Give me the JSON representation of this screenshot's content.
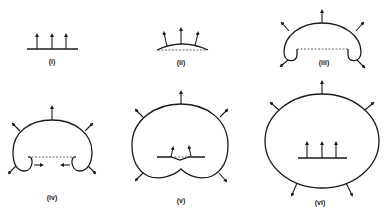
{
  "figure": {
    "panels": [
      {
        "id": "i",
        "label": "(i)",
        "description": "flat surface with three upward arrows"
      },
      {
        "id": "ii",
        "label": "(ii)",
        "description": "slightly curved arc bulging upward over dashed chord, arrows splay outward"
      },
      {
        "id": "iii",
        "label": "(iii)",
        "description": "expanding bubble with curled-under ends, dashed chord, outward arrows"
      },
      {
        "id": "iv",
        "label": "(iv)",
        "description": "larger bubble with curled ends approaching each other, dashed chord, inward arrows at tips"
      },
      {
        "id": "v",
        "label": "(v)",
        "description": "heart-shaped closed loop, ends have met and formed new inner surface with arrows"
      },
      {
        "id": "vi",
        "label": "(vi)",
        "description": "detached closed ellipse with a new flat surface inside with three upward arrows"
      }
    ],
    "line_color": "#1a1a1a",
    "background": "#ffffff"
  }
}
